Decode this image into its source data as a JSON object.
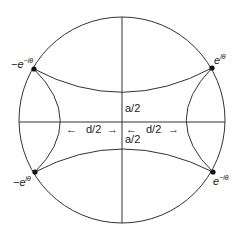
{
  "diagram": {
    "type": "hyperbolic-disk",
    "stroke_color": "#333333",
    "point_color": "#111111",
    "circle": {
      "cx": 122,
      "cy": 120,
      "r": 103
    },
    "points": [
      {
        "id": "top-left",
        "x": 34,
        "y": 69,
        "label_base": "−e",
        "label_sup": "−iθ"
      },
      {
        "id": "top-right",
        "x": 212,
        "y": 68,
        "label_base": "e",
        "label_sup": "iθ"
      },
      {
        "id": "bottom-left",
        "x": 35,
        "y": 172,
        "label_base": "−e",
        "label_sup": "iθ"
      },
      {
        "id": "bottom-right",
        "x": 213,
        "y": 172,
        "label_base": "e",
        "label_sup": "−iθ"
      }
    ],
    "labels": {
      "a_top": "a/2",
      "a_bottom": "a/2",
      "d_left": "d/2",
      "d_right": "d/2",
      "arrow_left": "←",
      "arrow_right": "→"
    }
  }
}
